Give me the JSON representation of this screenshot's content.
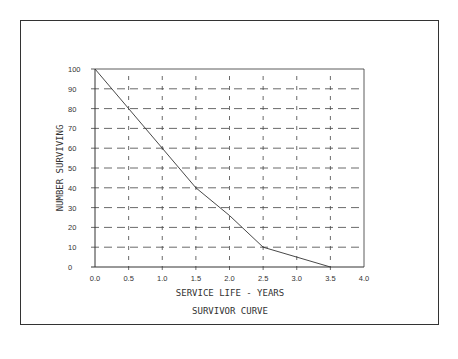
{
  "chart_data": {
    "type": "line",
    "title": "SURVIVOR CURVE",
    "xlabel": "SERVICE LIFE - YEARS",
    "ylabel": "NUMBER SURVIVING",
    "x_ticks": [
      "0.0",
      "0.5",
      "1.0",
      "1.5",
      "2.0",
      "2.5",
      "3.0",
      "3.5",
      "4.0"
    ],
    "y_ticks": [
      "0",
      "10",
      "20",
      "30",
      "40",
      "50",
      "60",
      "70",
      "80",
      "90",
      "100"
    ],
    "xlim": [
      0,
      4.0
    ],
    "ylim": [
      0,
      100
    ],
    "grid": "dashed",
    "legend": "none",
    "series": [
      {
        "name": "Survivor curve",
        "x": [
          0.0,
          0.5,
          1.0,
          1.5,
          2.0,
          2.5,
          3.0,
          3.5
        ],
        "y": [
          100,
          80,
          60,
          40,
          26,
          10,
          5,
          0
        ]
      }
    ]
  },
  "colors": {
    "line": "#333333",
    "grid": "#444444",
    "frame": "#333333"
  }
}
